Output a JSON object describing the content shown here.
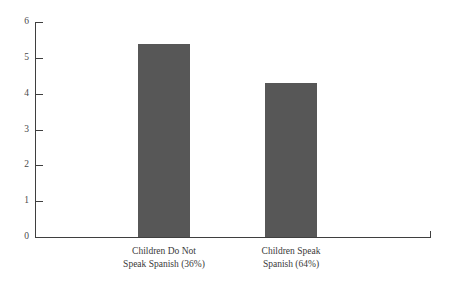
{
  "chart_data": {
    "type": "bar",
    "title": "",
    "subtitle": "",
    "xlabel": "",
    "ylabel": "",
    "categories": [
      "Children Do Not Speak Spanish (36%)",
      "Children Speak Spanish (64%)"
    ],
    "category_lines": [
      [
        "Children Do Not",
        "Speak Spanish (36%)"
      ],
      [
        "Children Speak",
        "Spanish (64%)"
      ]
    ],
    "values": [
      5.4,
      4.3
    ],
    "ylim": [
      0,
      6
    ],
    "ytick_labels": [
      "0",
      "1",
      "2",
      "3",
      "4",
      "5",
      "6"
    ],
    "ytick_values": [
      0,
      1,
      2,
      3,
      4,
      5,
      6
    ],
    "grid": false,
    "legend": false,
    "legend_position": "none",
    "bar_color": "#575757",
    "axis_color": "#3f3f3f",
    "text_color": "#3a3a3a",
    "background_color": "#ffffff"
  }
}
